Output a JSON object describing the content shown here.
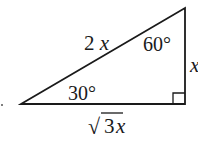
{
  "diagram": {
    "type": "30-60-90 right triangle",
    "hypotenuse_label": "2x",
    "short_leg_label": "x",
    "long_leg_label_radical": "√",
    "long_leg_label_coef": "3",
    "long_leg_label_var": "x",
    "angle_top": "60°",
    "angle_left": "30°",
    "right_angle_marker": true,
    "colors": {
      "stroke": "#1a1a1a",
      "background": "#ffffff"
    }
  }
}
